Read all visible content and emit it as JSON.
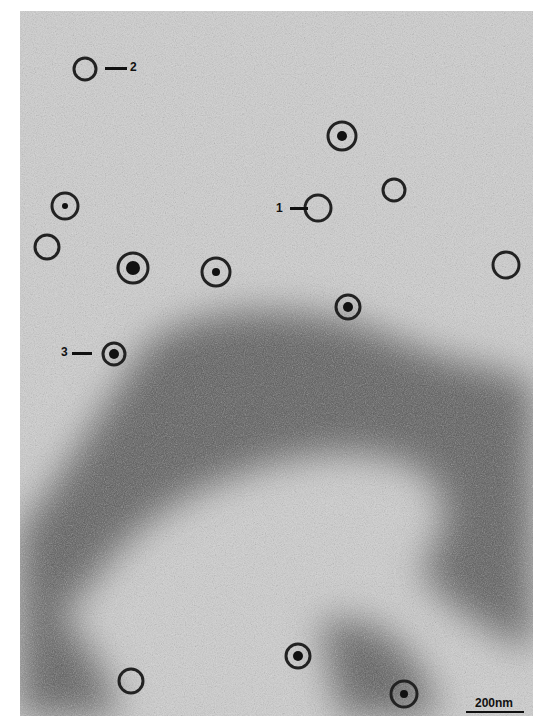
{
  "figure": {
    "type": "electron-micrograph",
    "labels": [
      {
        "text": "1",
        "x": 276,
        "y": 202
      },
      {
        "text": "2",
        "x": 128,
        "y": 8
      },
      {
        "text": "3",
        "x": 61,
        "y": 346
      }
    ],
    "scale_bar": {
      "text": "200nm"
    }
  }
}
